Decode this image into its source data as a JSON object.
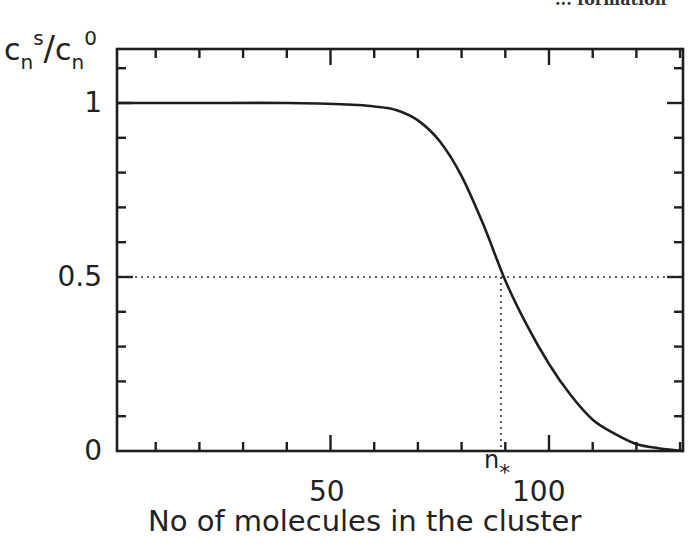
{
  "header_fragment": "... formation",
  "chart_data": {
    "type": "line",
    "title": "",
    "xlabel": "No of molecules in the cluster",
    "ylabel": "c_n^s / c_n^0",
    "ylabel_parts": {
      "base1": "c",
      "sub1": "n",
      "sup1": "s",
      "slash": "/",
      "base2": "c",
      "sub2": "n",
      "sup2": "0"
    },
    "xlim": [
      0,
      131
    ],
    "ylim": [
      0,
      1.15
    ],
    "x_ticks_major": [
      50,
      100
    ],
    "x_tick_labels": [
      "50",
      "100"
    ],
    "x_ticks_minor_step": 10,
    "y_ticks": [
      0,
      0.5,
      1
    ],
    "y_tick_labels": [
      "0",
      "0.5",
      "1"
    ],
    "y_ticks_minor_step": 0.1,
    "grid": false,
    "annotations": [
      {
        "type": "dotted-hline",
        "y": 0.5,
        "label": "0.5 reference"
      },
      {
        "type": "dotted-vline",
        "x": 89,
        "label": "n*"
      }
    ],
    "n_star_label": "n",
    "n_star_subscript": "*",
    "series": [
      {
        "name": "c_n^s / c_n^0",
        "x": [
          0,
          20,
          40,
          55,
          60,
          65,
          70,
          75,
          80,
          85,
          90,
          95,
          100,
          105,
          110,
          115,
          120,
          125,
          131
        ],
        "y": [
          1.0,
          1.0,
          1.0,
          0.995,
          0.99,
          0.98,
          0.95,
          0.89,
          0.79,
          0.65,
          0.49,
          0.36,
          0.25,
          0.16,
          0.09,
          0.05,
          0.02,
          0.008,
          0.0
        ]
      }
    ]
  }
}
